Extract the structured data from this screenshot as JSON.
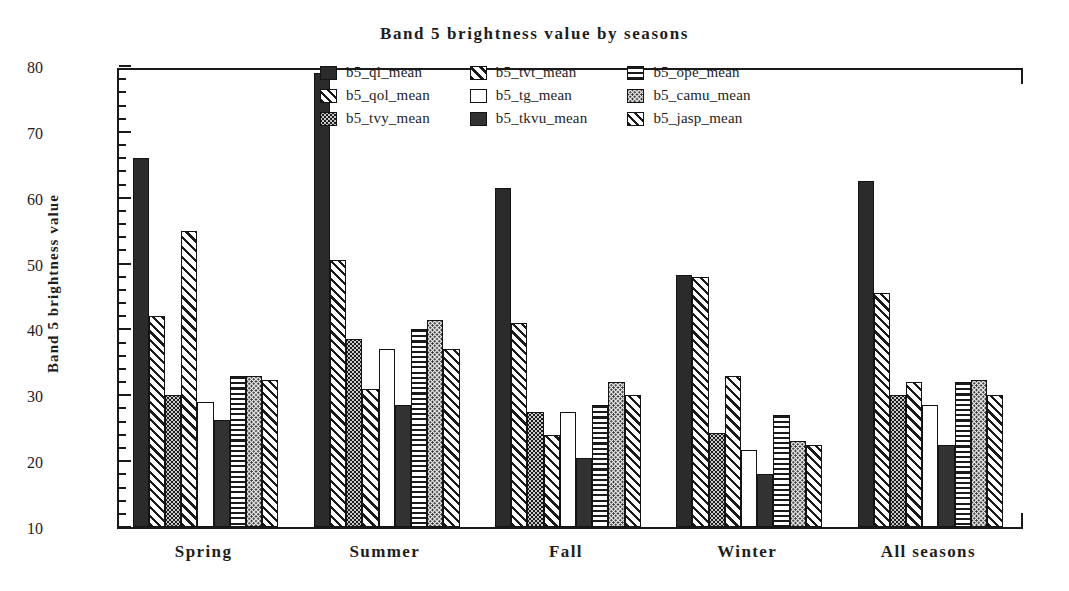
{
  "chart_data": {
    "type": "bar",
    "title": "Band 5 brightness value by seasons",
    "xlabel": "",
    "ylabel": "Band 5 brightness value",
    "ylim": [
      10,
      80
    ],
    "ytick_labels": [
      "10",
      "20",
      "30",
      "40",
      "50",
      "60",
      "70",
      "80"
    ],
    "ytick_values": [
      10,
      20,
      30,
      40,
      50,
      60,
      70,
      80
    ],
    "minor_tick_step": 2,
    "grid": false,
    "legend_position": "top-center-inside",
    "categories": [
      "Spring",
      "Summer",
      "Fall",
      "Winter",
      "All  seasons"
    ],
    "series": [
      {
        "name": "b5_ql_mean",
        "pattern": "solid-dark",
        "values": [
          66.0,
          79.0,
          61.5,
          48.3,
          62.5
        ]
      },
      {
        "name": "b5_qol_mean",
        "pattern": "diagonal-hatch",
        "values": [
          42.0,
          50.5,
          41.0,
          48.0,
          45.5
        ]
      },
      {
        "name": "b5_tvy_mean",
        "pattern": "dark-stipple",
        "values": [
          30.0,
          38.5,
          27.5,
          24.3,
          30.0
        ]
      },
      {
        "name": "b5_tvt_mean",
        "pattern": "diagonal-hatch2",
        "values": [
          55.0,
          31.0,
          24.0,
          33.0,
          32.0
        ]
      },
      {
        "name": "b5_tg_mean",
        "pattern": "white",
        "values": [
          29.0,
          37.0,
          27.5,
          21.7,
          28.5
        ]
      },
      {
        "name": "b5_tkvu_mean",
        "pattern": "solid-dark2",
        "values": [
          26.3,
          28.5,
          20.5,
          18.0,
          22.5
        ]
      },
      {
        "name": "b5_ope_mean",
        "pattern": "horizontal-lines",
        "values": [
          33.0,
          40.0,
          28.5,
          27.0,
          32.0
        ]
      },
      {
        "name": "b5_camu_mean",
        "pattern": "light-stipple",
        "values": [
          33.0,
          41.5,
          32.0,
          23.0,
          32.3
        ]
      },
      {
        "name": "b5_jasp_mean",
        "pattern": "diagonal-hatch",
        "values": [
          32.3,
          37.0,
          30.0,
          22.5,
          30.0
        ]
      }
    ]
  },
  "legend": {
    "items": [
      {
        "label": "b5_ql_mean"
      },
      {
        "label": "b5_tvt_mean"
      },
      {
        "label": "b5_ope_mean"
      },
      {
        "label": "b5_qol_mean"
      },
      {
        "label": "b5_tg_mean"
      },
      {
        "label": "b5_camu_mean"
      },
      {
        "label": "b5_tvy_mean"
      },
      {
        "label": "b5_tkvu_mean"
      },
      {
        "label": "b5_jasp_mean"
      }
    ]
  },
  "colors": {
    "foreground": "#1a1a1a",
    "background": "#ffffff",
    "bar_dark": "#2b2b2b"
  }
}
